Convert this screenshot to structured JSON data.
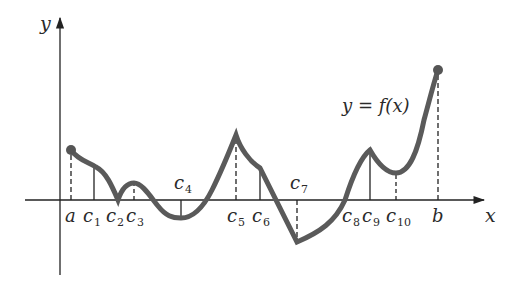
{
  "figure": {
    "axis_labels": {
      "x": "x",
      "y": "y"
    },
    "function_label": "y = f(x)",
    "colors": {
      "curve": "#5a5a5a",
      "axis": "#222222",
      "text": "#2a2a2a",
      "background": "#ffffff"
    },
    "points": [
      {
        "id": "a",
        "base": "a",
        "sub": "",
        "x": 71,
        "fy": 150,
        "line": "dashed",
        "label_pos": "below"
      },
      {
        "id": "c1",
        "base": "c",
        "sub": "1",
        "x": 94,
        "fy": 167,
        "line": "solid",
        "label_pos": "below"
      },
      {
        "id": "c2",
        "base": "c",
        "sub": "2",
        "x": 118,
        "fy": 200,
        "line": "none",
        "label_pos": "below"
      },
      {
        "id": "c3",
        "base": "c",
        "sub": "3",
        "x": 134,
        "fy": 183,
        "line": "dashed",
        "label_pos": "below"
      },
      {
        "id": "c4",
        "base": "c",
        "sub": "4",
        "x": 181,
        "fy": 218,
        "line": "solid",
        "label_pos": "above"
      },
      {
        "id": "c5",
        "base": "c",
        "sub": "5",
        "x": 236,
        "fy": 135,
        "line": "dashed",
        "label_pos": "below"
      },
      {
        "id": "c6",
        "base": "c",
        "sub": "6",
        "x": 260,
        "fy": 168,
        "line": "solid",
        "label_pos": "below"
      },
      {
        "id": "c7",
        "base": "c",
        "sub": "7",
        "x": 297,
        "fy": 242,
        "line": "dashed",
        "label_pos": "above"
      },
      {
        "id": "c8",
        "base": "c",
        "sub": "8",
        "x": 345,
        "fy": 200,
        "line": "none",
        "label_pos": "below"
      },
      {
        "id": "c9",
        "base": "c",
        "sub": "9",
        "x": 370,
        "fy": 150,
        "line": "solid",
        "label_pos": "below"
      },
      {
        "id": "c10",
        "base": "c",
        "sub": "10",
        "x": 396,
        "fy": 173,
        "line": "dashed",
        "label_pos": "below"
      },
      {
        "id": "b",
        "base": "b",
        "sub": "",
        "x": 438,
        "fy": 70,
        "line": "dashed",
        "label_pos": "below"
      }
    ]
  }
}
